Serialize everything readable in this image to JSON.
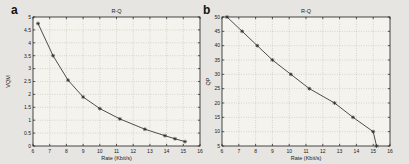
{
  "figure": {
    "background": "#e6e5e1",
    "plot_background": "#f4f3ee",
    "axis_color": "#1c1c1c",
    "grid_color": "#9fa89f",
    "line_color": "#454545",
    "marker_color": "#2b2b2b",
    "text_color": "#1a1a1a"
  },
  "panels": [
    {
      "letter": "a"
    },
    {
      "letter": "b"
    }
  ],
  "chart_data": [
    {
      "type": "line",
      "title": "R-Q",
      "xlabel": "Rate (Kbit/s)",
      "ylabel": "VQM",
      "xlim": [
        6,
        16
      ],
      "ylim": [
        0,
        5
      ],
      "xticks": [
        6,
        7,
        8,
        9,
        10,
        11,
        12,
        13,
        14,
        15,
        16
      ],
      "yticks": [
        0,
        0.5,
        1,
        1.5,
        2,
        2.5,
        3,
        3.5,
        4,
        4.5,
        5
      ],
      "grid": true,
      "legend": null,
      "marker": "asterisk",
      "series": [
        {
          "name": "VQM vs rate",
          "x": [
            6.3,
            7.2,
            8.1,
            9.0,
            10.0,
            11.2,
            12.7,
            13.9,
            14.5,
            15.1
          ],
          "y": [
            4.75,
            3.5,
            2.55,
            1.9,
            1.45,
            1.05,
            0.65,
            0.4,
            0.28,
            0.17
          ]
        }
      ]
    },
    {
      "type": "line",
      "title": "R-Q",
      "xlabel": "Rate (Kbit/s)",
      "ylabel": "QP",
      "xlim": [
        6,
        16
      ],
      "ylim": [
        5,
        50
      ],
      "xticks": [
        6,
        7,
        8,
        9,
        10,
        11,
        12,
        13,
        14,
        15,
        16
      ],
      "yticks": [
        5,
        10,
        15,
        20,
        25,
        30,
        35,
        40,
        45,
        50
      ],
      "grid": true,
      "legend": null,
      "marker": "asterisk",
      "series": [
        {
          "name": "QP vs rate",
          "x": [
            6.3,
            7.2,
            8.1,
            9.0,
            10.1,
            11.2,
            12.7,
            13.8,
            15.0,
            15.2
          ],
          "y": [
            50,
            45,
            40,
            35,
            30,
            25,
            20,
            15,
            10,
            5
          ]
        }
      ]
    }
  ]
}
